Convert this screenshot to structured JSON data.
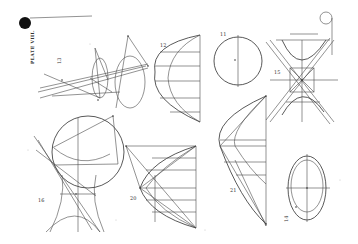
{
  "plate": {
    "title": "PLATE VIII.",
    "background_color": "#ffffff",
    "ink_color": "#3a3a3a"
  },
  "figures": [
    {
      "id": "fig-cone",
      "number": "13",
      "description": "cone section with projecting lines"
    },
    {
      "id": "fig-parabola-grid",
      "number": "12",
      "description": "semi-ellipse with ordinate lines"
    },
    {
      "id": "fig-circle",
      "number": "11",
      "description": "circle with diameter"
    },
    {
      "id": "fig-hyperbola",
      "number": "15",
      "description": "conjugate hyperbolas with asymptotes"
    },
    {
      "id": "fig-circle-hyperbola",
      "number": "16",
      "description": "circle with hyperbola construction"
    },
    {
      "id": "fig-parabola-chords",
      "number": "20",
      "description": "parabola with chords"
    },
    {
      "id": "fig-curve-ordinates",
      "number": "21",
      "description": "curve construction with ordinates"
    },
    {
      "id": "fig-ellipse",
      "number": "14",
      "description": "concentric ellipses"
    }
  ]
}
